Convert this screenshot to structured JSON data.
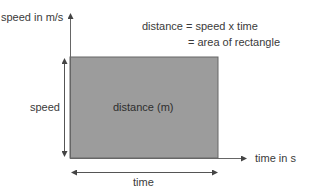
{
  "diagram": {
    "y_axis_label": "speed in m/s",
    "x_axis_label": "time in s",
    "equation_line1": "distance = speed x time",
    "equation_line2": "= area of rectangle",
    "rect_label": "distance (m)",
    "height_label": "speed",
    "width_label": "time",
    "colors": {
      "rectangle_fill": "#9c9c9c",
      "rectangle_edge": "#555555",
      "axis": "#555555",
      "text": "#3a3a3a"
    }
  }
}
